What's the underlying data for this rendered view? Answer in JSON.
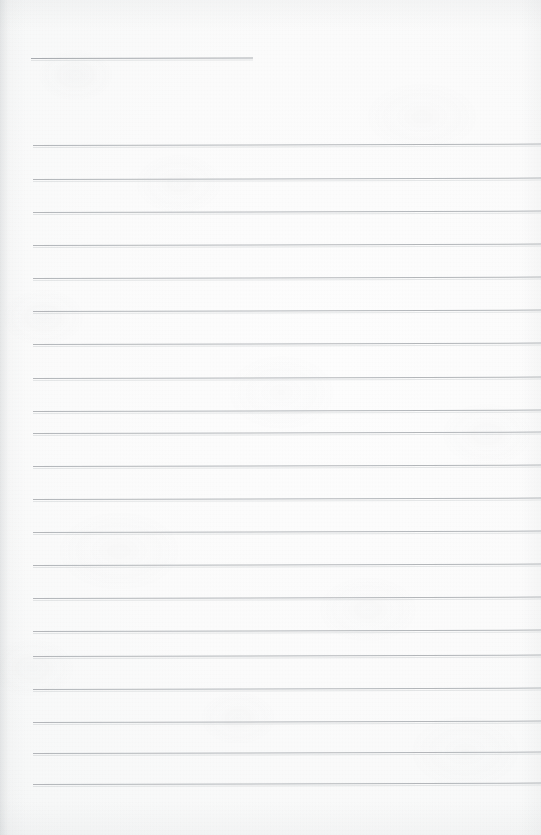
{
  "document": {
    "kind": "scanned-ruled-notebook-page",
    "title": "",
    "body_text": "",
    "is_blank": "true",
    "page_width": 541,
    "page_height": 835
  },
  "appearance": {
    "paper_color": "#fbfbfb",
    "paper_highlight": "#fdfdfd",
    "paper_shadow": "#f2f3f4",
    "rule_color": "#a9adb1",
    "header_rule_color": "#9ca0a5",
    "edge_shadow_color": "#8a9095"
  },
  "layout": {
    "rule_left_x": 33,
    "rule_right_x": 541,
    "rule_spacing": 33.6,
    "rule_tilt_deg": -0.16,
    "header_rule": {
      "label": "header-rule",
      "x": 31,
      "y": 58,
      "width": 222
    }
  },
  "rules": [
    {
      "label": "header-rule",
      "y": 58,
      "x": 31,
      "width": 222,
      "kind": "header"
    },
    {
      "label": "body-rule-1",
      "y": 145,
      "x": 33,
      "width": 508,
      "kind": "body"
    },
    {
      "label": "body-rule-2",
      "y": 179,
      "x": 33,
      "width": 508,
      "kind": "body"
    },
    {
      "label": "body-rule-3",
      "y": 212,
      "x": 33,
      "width": 508,
      "kind": "body"
    },
    {
      "label": "body-rule-4",
      "y": 245,
      "x": 33,
      "width": 508,
      "kind": "body"
    },
    {
      "label": "body-rule-5",
      "y": 278,
      "x": 33,
      "width": 508,
      "kind": "body"
    },
    {
      "label": "body-rule-6",
      "y": 311,
      "x": 33,
      "width": 508,
      "kind": "body"
    },
    {
      "label": "body-rule-7",
      "y": 344,
      "x": 33,
      "width": 508,
      "kind": "body"
    },
    {
      "label": "body-rule-8",
      "y": 378,
      "x": 33,
      "width": 508,
      "kind": "body"
    },
    {
      "label": "body-rule-9",
      "y": 411,
      "x": 33,
      "width": 508,
      "kind": "body"
    },
    {
      "label": "body-rule-10",
      "y": 433,
      "x": 33,
      "width": 508,
      "kind": "body"
    },
    {
      "label": "body-rule-11",
      "y": 466,
      "x": 33,
      "width": 508,
      "kind": "body"
    },
    {
      "label": "body-rule-12",
      "y": 499,
      "x": 33,
      "width": 508,
      "kind": "body"
    },
    {
      "label": "body-rule-13",
      "y": 532,
      "x": 33,
      "width": 508,
      "kind": "body"
    },
    {
      "label": "body-rule-14",
      "y": 565,
      "x": 33,
      "width": 508,
      "kind": "body"
    },
    {
      "label": "body-rule-15",
      "y": 598,
      "x": 33,
      "width": 508,
      "kind": "body"
    },
    {
      "label": "body-rule-16",
      "y": 631,
      "x": 33,
      "width": 508,
      "kind": "body"
    },
    {
      "label": "body-rule-17",
      "y": 656,
      "x": 33,
      "width": 508,
      "kind": "body"
    },
    {
      "label": "body-rule-18",
      "y": 689,
      "x": 33,
      "width": 508,
      "kind": "body"
    },
    {
      "label": "body-rule-19",
      "y": 722,
      "x": 33,
      "width": 508,
      "kind": "body"
    },
    {
      "label": "body-rule-20",
      "y": 753,
      "x": 33,
      "width": 508,
      "kind": "body"
    },
    {
      "label": "body-rule-21",
      "y": 784,
      "x": 33,
      "width": 508,
      "kind": "body"
    }
  ]
}
